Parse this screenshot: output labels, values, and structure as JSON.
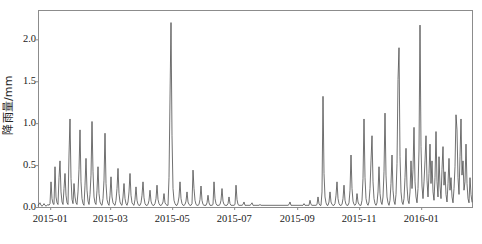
{
  "chart_data": {
    "type": "line",
    "title": "",
    "subtitle": "",
    "xlabel": "",
    "ylabel": "降雨量/mm",
    "ylabel_text": "降雨量/mm",
    "legend": [],
    "legend_position": "none",
    "grid": false,
    "line_color": "#4d4d4d",
    "axis_color": "#8c8c8c",
    "background": "#ffffff",
    "xlim": [
      "2014-12-20",
      "2016-02-20"
    ],
    "ylim": [
      0.0,
      2.35
    ],
    "yticks": [
      0.0,
      0.5,
      1.0,
      1.5,
      2.0
    ],
    "ytick_labels": [
      "0.0",
      "0.5",
      "1.0",
      "1.5",
      "2.0"
    ],
    "xticks": [
      "2015-01",
      "2015-03",
      "2015-05",
      "2015-07",
      "2015-09",
      "2015-11",
      "2016-01"
    ],
    "xtick_labels": [
      "2015-01",
      "2015-03",
      "2015-05",
      "2015-07",
      "2015-09",
      "2015-11",
      "2016-01"
    ],
    "x_start_day": 0,
    "x_end_day": 427,
    "xtick_days": [
      12,
      71,
      132,
      193,
      255,
      316,
      377
    ],
    "series": [
      {
        "name": "降雨量",
        "unit": "mm",
        "values": [
          0.02,
          0.03,
          0.05,
          0.02,
          0.01,
          0.02,
          0.04,
          0.02,
          0.01,
          0.02,
          0.03,
          0.02,
          0.04,
          0.3,
          0.1,
          0.04,
          0.03,
          0.48,
          0.12,
          0.05,
          0.03,
          0.35,
          0.55,
          0.18,
          0.06,
          0.03,
          0.22,
          0.4,
          0.14,
          0.05,
          0.03,
          0.62,
          1.05,
          0.34,
          0.09,
          0.04,
          0.28,
          0.12,
          0.05,
          0.03,
          0.18,
          0.45,
          0.92,
          0.3,
          0.1,
          0.04,
          0.02,
          0.26,
          0.58,
          0.2,
          0.07,
          0.03,
          0.15,
          0.38,
          1.02,
          0.42,
          0.12,
          0.05,
          0.03,
          0.2,
          0.48,
          0.16,
          0.06,
          0.03,
          0.02,
          0.1,
          0.32,
          0.88,
          0.28,
          0.09,
          0.04,
          0.02,
          0.14,
          0.36,
          0.12,
          0.05,
          0.03,
          0.02,
          0.08,
          0.22,
          0.46,
          0.16,
          0.06,
          0.03,
          0.02,
          0.12,
          0.28,
          0.1,
          0.04,
          0.02,
          0.06,
          0.18,
          0.4,
          0.14,
          0.05,
          0.03,
          0.02,
          0.09,
          0.24,
          0.08,
          0.03,
          0.02,
          0.02,
          0.05,
          0.14,
          0.3,
          0.11,
          0.04,
          0.02,
          0.02,
          0.03,
          0.08,
          0.2,
          0.07,
          0.03,
          0.02,
          0.02,
          0.04,
          0.1,
          0.26,
          0.09,
          0.04,
          0.02,
          0.02,
          0.03,
          0.06,
          0.16,
          0.05,
          0.03,
          0.02,
          0.02,
          0.35,
          1.3,
          2.2,
          0.85,
          0.22,
          0.08,
          0.04,
          0.02,
          0.02,
          0.05,
          0.12,
          0.3,
          0.1,
          0.04,
          0.02,
          0.02,
          0.03,
          0.07,
          0.18,
          0.06,
          0.03,
          0.02,
          0.02,
          0.04,
          0.44,
          0.22,
          0.08,
          0.03,
          0.02,
          0.02,
          0.03,
          0.09,
          0.25,
          0.08,
          0.03,
          0.02,
          0.02,
          0.02,
          0.05,
          0.14,
          0.05,
          0.02,
          0.02,
          0.02,
          0.03,
          0.3,
          0.1,
          0.04,
          0.02,
          0.02,
          0.02,
          0.03,
          0.08,
          0.22,
          0.07,
          0.03,
          0.02,
          0.02,
          0.02,
          0.04,
          0.12,
          0.04,
          0.02,
          0.02,
          0.02,
          0.02,
          0.03,
          0.26,
          0.09,
          0.03,
          0.02,
          0.02,
          0.02,
          0.02,
          0.03,
          0.06,
          0.02,
          0.02,
          0.02,
          0.02,
          0.02,
          0.02,
          0.03,
          0.05,
          0.02,
          0.02,
          0.02,
          0.02,
          0.02,
          0.02,
          0.02,
          0.03,
          0.02,
          0.02,
          0.02,
          0.02,
          0.02,
          0.02,
          0.02,
          0.02,
          0.02,
          0.02,
          0.02,
          0.02,
          0.02,
          0.02,
          0.02,
          0.02,
          0.02,
          0.02,
          0.02,
          0.02,
          0.02,
          0.02,
          0.02,
          0.02,
          0.02,
          0.02,
          0.02,
          0.02,
          0.03,
          0.06,
          0.02,
          0.02,
          0.02,
          0.02,
          0.02,
          0.02,
          0.02,
          0.02,
          0.02,
          0.02,
          0.02,
          0.02,
          0.02,
          0.04,
          0.02,
          0.02,
          0.02,
          0.02,
          0.02,
          0.08,
          0.03,
          0.02,
          0.02,
          0.02,
          0.02,
          0.02,
          0.03,
          0.12,
          0.04,
          0.02,
          0.02,
          0.18,
          1.32,
          0.4,
          0.12,
          0.05,
          0.02,
          0.02,
          0.06,
          0.18,
          0.06,
          0.03,
          0.02,
          0.02,
          0.04,
          0.14,
          0.3,
          0.1,
          0.04,
          0.02,
          0.02,
          0.03,
          0.1,
          0.26,
          0.08,
          0.03,
          0.02,
          0.02,
          0.05,
          0.2,
          0.62,
          0.22,
          0.07,
          0.03,
          0.02,
          0.04,
          0.16,
          0.06,
          0.03,
          0.02,
          0.02,
          0.08,
          0.34,
          1.05,
          0.35,
          0.1,
          0.04,
          0.02,
          0.06,
          0.22,
          0.55,
          0.85,
          0.3,
          0.1,
          0.04,
          0.02,
          0.05,
          0.18,
          0.48,
          0.16,
          0.06,
          0.03,
          0.12,
          0.42,
          1.12,
          0.38,
          0.12,
          0.05,
          0.02,
          0.08,
          0.28,
          0.62,
          0.2,
          0.07,
          0.03,
          0.15,
          0.52,
          1.52,
          1.9,
          0.6,
          0.18,
          0.06,
          0.03,
          0.1,
          0.35,
          0.7,
          0.25,
          0.08,
          0.04,
          0.18,
          0.55,
          0.22,
          0.45,
          0.95,
          0.3,
          0.12,
          0.05,
          0.22,
          0.68,
          2.17,
          0.72,
          0.25,
          0.1,
          0.3,
          0.55,
          0.85,
          0.32,
          0.12,
          0.4,
          0.75,
          0.28,
          0.55,
          0.18,
          0.08,
          0.35,
          0.9,
          0.3,
          0.12,
          0.6,
          0.25,
          0.1,
          0.45,
          0.72,
          0.26,
          0.42,
          0.15,
          0.06,
          0.28,
          0.58,
          0.2,
          0.35,
          0.12,
          0.05,
          0.22,
          0.48,
          1.1,
          0.92,
          0.35,
          0.15,
          0.6,
          1.05,
          0.38,
          0.55,
          0.2,
          0.3,
          0.75,
          0.28,
          0.1,
          0.05,
          0.35,
          0.15,
          0.06
        ]
      }
    ]
  },
  "axes": {
    "frame": {
      "left_px": 38,
      "right_px": 472,
      "top_px": 10,
      "bottom_px": 207
    }
  }
}
